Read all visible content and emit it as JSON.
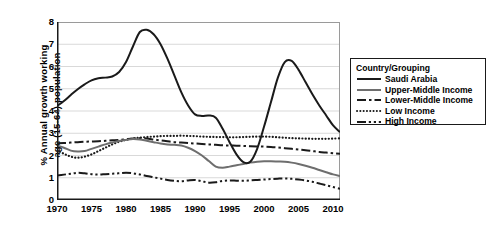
{
  "chart_data": {
    "type": "line",
    "title": "",
    "xlabel": "",
    "ylabel": "% Annual growth working\nage (15-64) population",
    "xlim": [
      1970,
      2011
    ],
    "ylim": [
      0,
      8
    ],
    "yticks": [
      0,
      1,
      2,
      3,
      4,
      5,
      6,
      7,
      8
    ],
    "xticks": [
      1970,
      1975,
      1980,
      1985,
      1990,
      1995,
      2000,
      2005,
      2010
    ],
    "grid": "horizontal",
    "legend_position": "right-outside",
    "legend_title": "Country/Grouping",
    "x": [
      1970,
      1971,
      1972,
      1973,
      1974,
      1975,
      1976,
      1977,
      1978,
      1979,
      1980,
      1981,
      1982,
      1983,
      1984,
      1985,
      1986,
      1987,
      1988,
      1989,
      1990,
      1991,
      1992,
      1993,
      1994,
      1995,
      1996,
      1997,
      1998,
      1999,
      2000,
      2001,
      2002,
      2003,
      2004,
      2005,
      2006,
      2007,
      2008,
      2009,
      2010,
      2011
    ],
    "series": [
      {
        "name": "Saudi Arabia",
        "style": "solid",
        "color": "#1a1a1a",
        "width": 2.0,
        "values": [
          4.22,
          4.45,
          4.72,
          4.98,
          5.2,
          5.38,
          5.47,
          5.5,
          5.55,
          5.75,
          6.2,
          6.9,
          7.55,
          7.65,
          7.45,
          7.0,
          6.35,
          5.6,
          4.85,
          4.25,
          3.85,
          3.78,
          3.8,
          3.7,
          3.2,
          2.6,
          2.05,
          1.7,
          1.72,
          2.3,
          3.3,
          4.4,
          5.5,
          6.2,
          6.25,
          5.85,
          5.3,
          4.75,
          4.25,
          3.8,
          3.35,
          3.05
        ]
      },
      {
        "name": "Upper-Middle Income",
        "style": "solid",
        "color": "#6e6e6e",
        "width": 2.0,
        "values": [
          2.45,
          2.35,
          2.22,
          2.18,
          2.2,
          2.3,
          2.4,
          2.5,
          2.58,
          2.65,
          2.7,
          2.74,
          2.72,
          2.66,
          2.6,
          2.54,
          2.5,
          2.48,
          2.45,
          2.35,
          2.2,
          2.0,
          1.75,
          1.5,
          1.45,
          1.5,
          1.56,
          1.62,
          1.68,
          1.72,
          1.74,
          1.74,
          1.73,
          1.72,
          1.68,
          1.62,
          1.54,
          1.45,
          1.35,
          1.25,
          1.15,
          1.08
        ]
      },
      {
        "name": "Lower-Middle Income",
        "style": "dashdot",
        "color": "#1a1a1a",
        "width": 2.0,
        "values": [
          2.55,
          2.56,
          2.58,
          2.6,
          2.62,
          2.63,
          2.64,
          2.66,
          2.68,
          2.7,
          2.73,
          2.76,
          2.78,
          2.76,
          2.72,
          2.68,
          2.64,
          2.6,
          2.58,
          2.56,
          2.54,
          2.52,
          2.5,
          2.48,
          2.46,
          2.45,
          2.44,
          2.43,
          2.42,
          2.41,
          2.4,
          2.38,
          2.36,
          2.33,
          2.3,
          2.27,
          2.24,
          2.2,
          2.16,
          2.13,
          2.1,
          2.08
        ]
      },
      {
        "name": "Low Income",
        "style": "dotted",
        "color": "#1a1a1a",
        "width": 2.2,
        "values": [
          2.25,
          2.08,
          1.95,
          1.9,
          1.95,
          2.05,
          2.2,
          2.35,
          2.5,
          2.62,
          2.7,
          2.76,
          2.8,
          2.83,
          2.85,
          2.87,
          2.88,
          2.88,
          2.89,
          2.88,
          2.87,
          2.85,
          2.84,
          2.83,
          2.83,
          2.82,
          2.82,
          2.83,
          2.84,
          2.85,
          2.85,
          2.84,
          2.82,
          2.8,
          2.78,
          2.77,
          2.76,
          2.75,
          2.75,
          2.75,
          2.76,
          2.77
        ]
      },
      {
        "name": "High Income",
        "style": "dashdotdot",
        "color": "#1a1a1a",
        "width": 2.0,
        "values": [
          1.1,
          1.14,
          1.18,
          1.22,
          1.2,
          1.16,
          1.14,
          1.16,
          1.18,
          1.2,
          1.22,
          1.2,
          1.15,
          1.08,
          1.02,
          0.96,
          0.9,
          0.86,
          0.84,
          0.88,
          0.9,
          0.84,
          0.78,
          0.8,
          0.86,
          0.88,
          0.87,
          0.86,
          0.88,
          0.9,
          0.92,
          0.94,
          0.96,
          0.97,
          0.95,
          0.92,
          0.88,
          0.82,
          0.74,
          0.66,
          0.58,
          0.5
        ]
      }
    ]
  },
  "legend": {
    "title": "Country/Grouping",
    "items": [
      {
        "label": "Saudi Arabia",
        "style": "solid",
        "color": "#1a1a1a"
      },
      {
        "label": "Upper-Middle Income",
        "style": "solid",
        "color": "#6e6e6e"
      },
      {
        "label": "Lower-Middle Income",
        "style": "dashdot",
        "color": "#1a1a1a"
      },
      {
        "label": "Low Income",
        "style": "dotted",
        "color": "#1a1a1a"
      },
      {
        "label": "High Income",
        "style": "dashdotdot",
        "color": "#1a1a1a"
      }
    ]
  },
  "axes": {
    "y_title": "% Annual growth working\nage (15-64) population",
    "y_tick_labels": [
      "8",
      "7",
      "6",
      "5",
      "4",
      "3",
      "2",
      "1",
      "0"
    ],
    "x_tick_labels": [
      "1970",
      "1975",
      "1980",
      "1985",
      "1990",
      "1995",
      "2000",
      "2005",
      "2010"
    ]
  },
  "colors": {
    "axis": "#1a1a1a",
    "grid": "#d9d9d9",
    "background": "#ffffff"
  }
}
